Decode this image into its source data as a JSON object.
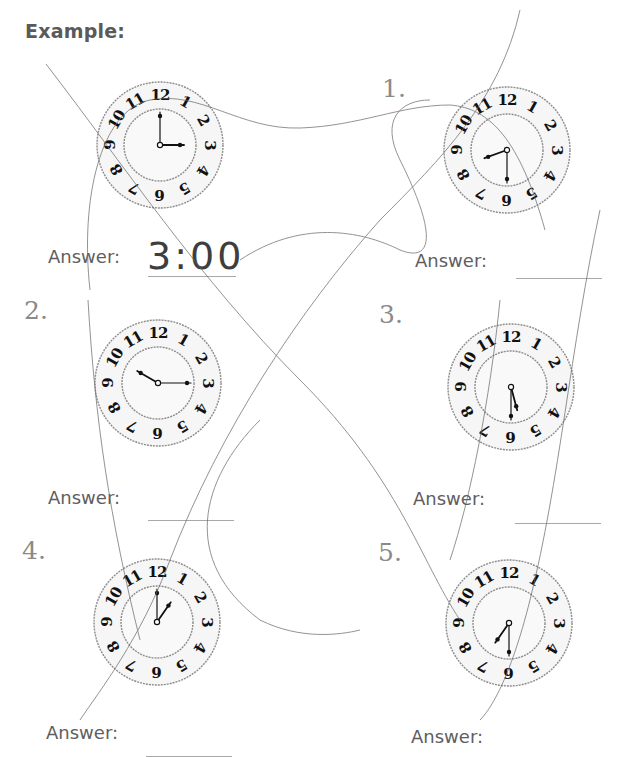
{
  "worksheet": {
    "heading": "Example:",
    "answer_label": "Answer:",
    "example": {
      "answer": "3:00",
      "hour_angle": 90,
      "minute_angle": 0
    },
    "problems": [
      {
        "number": "1.",
        "answer": "",
        "hour_angle": 250,
        "minute_angle": 180
      },
      {
        "number": "2.",
        "answer": "",
        "hour_angle": 300,
        "minute_angle": 90
      },
      {
        "number": "3.",
        "answer": "",
        "hour_angle": 165,
        "minute_angle": 180
      },
      {
        "number": "4.",
        "answer": "",
        "hour_angle": 35,
        "minute_angle": 0
      },
      {
        "number": "5.",
        "answer": "",
        "hour_angle": 215,
        "minute_angle": 180
      }
    ],
    "clock_numerals": [
      "12",
      "1",
      "2",
      "3",
      "4",
      "5",
      "6",
      "7",
      "8",
      "9",
      "10",
      "11"
    ]
  },
  "colors": {
    "heading": "#5a5a5a",
    "problem_number": "#8a8a8a",
    "answer_label": "#5e5e5e",
    "clock_ink": "#111111",
    "clock_ring": "#8c8c8c",
    "scribble": "#6a6a6a"
  }
}
